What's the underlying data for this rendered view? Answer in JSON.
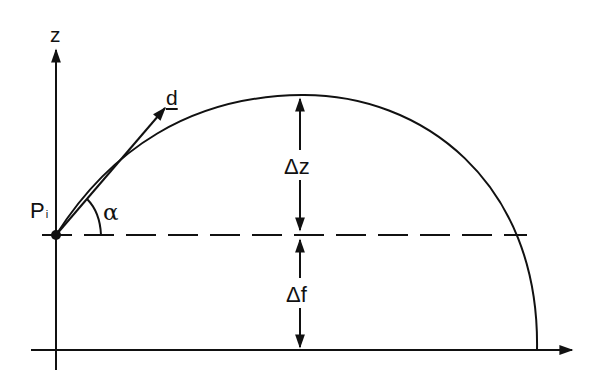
{
  "diagram": {
    "labels": {
      "z_axis": "z",
      "direction_vector": "d",
      "point_main": "P",
      "point_sub": "i",
      "angle": "α",
      "rise": "Δz",
      "drop": "Δf"
    },
    "colors": {
      "stroke": "#111111",
      "background": "#ffffff"
    },
    "geometry": {
      "z_axis_x": 56,
      "horizontal_axis_y": 350,
      "dashed_level_y": 235,
      "start_point": [
        56,
        235
      ],
      "apex": [
        302,
        95
      ],
      "landing_point": [
        537,
        350
      ],
      "direction_tip": [
        165,
        108
      ],
      "measure_x": 300
    }
  }
}
